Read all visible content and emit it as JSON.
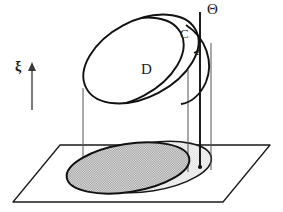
{
  "figure": {
    "labels": {
      "domain_D": "D",
      "curve_C": "C",
      "point_a": "a",
      "set_theta": "Θ",
      "axis_xi": "ξ"
    },
    "colors": {
      "stroke": "#1a1a1a",
      "thin_stroke": "#4d4d4d",
      "shaded_dark": "#a8a8a8",
      "shaded_light": "#e0e0e0",
      "background": "#ffffff"
    },
    "elements": [
      {
        "name": "ground-plane",
        "type": "parallelogram",
        "description": "horizontal base plane drawn in perspective"
      },
      {
        "name": "base-ellipse-dark",
        "type": "ellipse",
        "description": "shaded projection of D onto the plane"
      },
      {
        "name": "base-ellipse-light",
        "type": "ellipse",
        "description": "lighter shaded region behind, projection of the cap"
      },
      {
        "name": "cap-ellipse-D",
        "type": "ellipse",
        "description": "tilted upper surface labelled D"
      },
      {
        "name": "curve-C",
        "type": "arc",
        "description": "boundary arc labelled C"
      },
      {
        "name": "theta-line",
        "type": "vertical-line",
        "description": "vertical fiber labelled Theta ending at point a"
      },
      {
        "name": "xi-axis-arrow",
        "type": "arrow",
        "description": "upward axis arrow labelled xi"
      }
    ]
  }
}
